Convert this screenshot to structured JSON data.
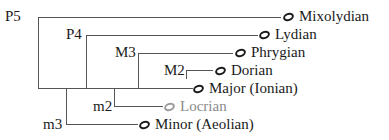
{
  "diagram": {
    "type": "tree",
    "interval_labels": [
      {
        "id": "p5",
        "text": "P5"
      },
      {
        "id": "p4",
        "text": "P4"
      },
      {
        "id": "m3_major",
        "text": "M3"
      },
      {
        "id": "m2_major",
        "text": "M2"
      },
      {
        "id": "m2_minor",
        "text": "m2"
      },
      {
        "id": "m3_minor",
        "text": "m3"
      }
    ],
    "modes": [
      {
        "id": "mixolydian",
        "name": "Mixolydian",
        "icon": "whole-note-icon",
        "dimmed": false
      },
      {
        "id": "lydian",
        "name": "Lydian",
        "icon": "whole-note-icon",
        "dimmed": false
      },
      {
        "id": "phrygian",
        "name": "Phrygian",
        "icon": "whole-note-icon",
        "dimmed": false
      },
      {
        "id": "dorian",
        "name": "Dorian",
        "icon": "whole-note-icon",
        "dimmed": false
      },
      {
        "id": "major",
        "name": "Major (Ionian)",
        "icon": "whole-note-icon",
        "dimmed": false
      },
      {
        "id": "locrian",
        "name": "Locrian",
        "icon": "whole-note-icon",
        "dimmed": true
      },
      {
        "id": "minor",
        "name": "Minor (Aeolian)",
        "icon": "whole-note-icon",
        "dimmed": false
      }
    ],
    "colors": {
      "line": "#555555",
      "text": "#1a1a1a",
      "dimmed": "#8a8a8a"
    }
  }
}
